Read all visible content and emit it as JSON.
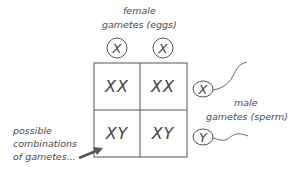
{
  "female": {
    "label_line1": "female",
    "label_line2": "gametes (eggs)",
    "gametes": [
      "X",
      "X"
    ]
  },
  "male": {
    "label_line1": "male",
    "label_line2": "gametes (sperm)",
    "gametes": [
      "X",
      "Y"
    ]
  },
  "grid": {
    "cells": [
      [
        "XX",
        "XX"
      ],
      [
        "XY",
        "XY"
      ]
    ]
  },
  "annotation": {
    "line1": "possible",
    "line2": "combinations",
    "line3": "of gametes..."
  }
}
